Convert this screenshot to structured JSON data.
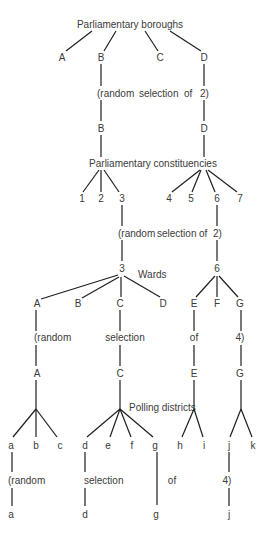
{
  "diagram": {
    "levels": {
      "boroughs": "Parliamentary boroughs",
      "constituencies": "Parliamentary constituencies",
      "wards": "Wards",
      "polling": "Polling districts"
    },
    "selection_words": {
      "open": "(random",
      "selection": "selection",
      "of": "of",
      "two": "2)",
      "four": "4)"
    },
    "boroughs": [
      "A",
      "B",
      "C",
      "D"
    ],
    "selected_boroughs": [
      "B",
      "D"
    ],
    "constituencies": [
      "1",
      "2",
      "3",
      "4",
      "5",
      "6",
      "7"
    ],
    "selected_constituencies": [
      "3",
      "6"
    ],
    "wards": [
      "A",
      "B",
      "C",
      "D",
      "E",
      "F",
      "G"
    ],
    "selected_wards": [
      "A",
      "C",
      "E",
      "G"
    ],
    "polling_districts": [
      "a",
      "b",
      "c",
      "d",
      "e",
      "f",
      "g",
      "h",
      "i",
      "j",
      "k"
    ],
    "selected_polling_districts": [
      "a",
      "d",
      "g",
      "j"
    ],
    "colors": {
      "line": "#1e1e1e",
      "text": "#3a3a3a",
      "background": "#ffffff"
    }
  }
}
